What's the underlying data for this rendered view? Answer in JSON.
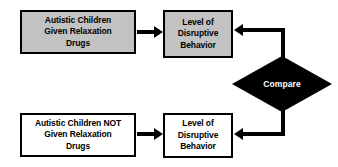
{
  "diagram": {
    "background_color": "#ffffff",
    "line_color": "#000000",
    "filled_node_color": "#c2c2c2",
    "plain_node_color": "#ffffff",
    "diamond_fill_color": "#000000",
    "diamond_text_color": "#ffffff"
  },
  "nodes": {
    "treatment_group": {
      "lines": [
        "Autistic Children",
        "Given Relaxation",
        "Drugs"
      ]
    },
    "treatment_outcome": {
      "lines": [
        "Level of",
        "Disruptive",
        "Behavior"
      ]
    },
    "control_group": {
      "lines": [
        "Autistic Children NOT",
        "Given Relaxation",
        "Drugs"
      ]
    },
    "control_outcome": {
      "lines": [
        "Level of",
        "Disruptive",
        "Behavior"
      ]
    },
    "compare": {
      "label": "Compare"
    }
  },
  "connectors": [
    {
      "name": "treatment-group-to-outcome",
      "from": "treatment_group",
      "to": "treatment_outcome",
      "direction": "right"
    },
    {
      "name": "control-group-to-outcome",
      "from": "control_group",
      "to": "control_outcome",
      "direction": "right"
    },
    {
      "name": "compare-to-treatment-outcome",
      "from": "compare",
      "to": "treatment_outcome",
      "direction": "left"
    },
    {
      "name": "compare-to-control-outcome",
      "from": "compare",
      "to": "control_outcome",
      "direction": "left"
    }
  ]
}
